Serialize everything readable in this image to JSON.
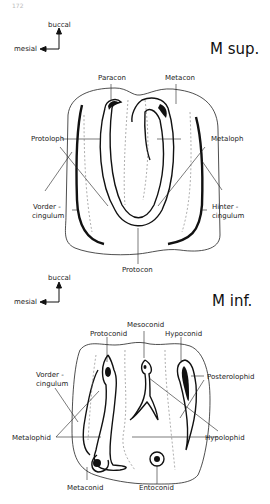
{
  "page_number": "172",
  "upper_molar": {
    "title": "M sup.",
    "orientation": {
      "vertical": "buccal",
      "horizontal": "mesial"
    },
    "labels": {
      "paracon": "Paracon",
      "metacon": "Metacon",
      "protoloph": "Protoloph",
      "metaloph": "Metaloph",
      "vordercingulum_1": "Vorder -",
      "vordercingulum_2": "cingulum",
      "hintercingulum_1": "Hinter -",
      "hintercingulum_2": "cingulum",
      "protocon": "Protocon"
    }
  },
  "lower_molar": {
    "title": "M inf.",
    "orientation": {
      "vertical": "buccal",
      "horizontal": "mesial"
    },
    "labels": {
      "protoconid": "Protoconid",
      "mesoconid": "Mesoconid",
      "hypoconid": "Hypoconid",
      "vordercingulum_1": "Vorder -",
      "vordercingulum_2": "cingulum",
      "posterolophid": "Posterolophid",
      "metalophid": "Metalophid",
      "hypolophid": "Hypolophid",
      "metaconid": "Metaconid",
      "entoconid": "Entoconid"
    }
  }
}
